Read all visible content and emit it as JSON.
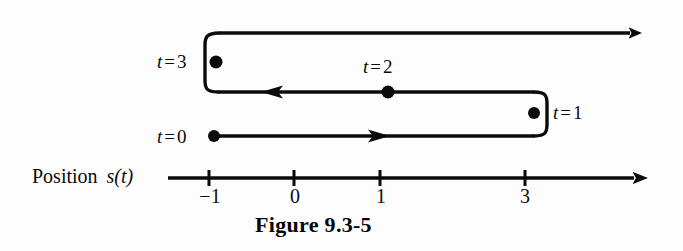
{
  "figure": {
    "caption": "Figure 9.3-5",
    "background_color": "#fdfdfd",
    "ink_color": "#0b0b0b"
  },
  "axis": {
    "name": "position-number-line",
    "label_word": "Position",
    "label_function": "s(t)",
    "arrow_direction": "right",
    "ticks": [
      {
        "label": "−1",
        "value": -1,
        "x": 209
      },
      {
        "label": "0",
        "value": 0,
        "x": 294
      },
      {
        "label": "1",
        "value": 1,
        "x": 380
      },
      {
        "label": "3",
        "value": 3,
        "x": 525
      }
    ],
    "line_y": 178,
    "line_start_x": 168,
    "line_end_x": 652
  },
  "motion_path": {
    "description": "Particle path doubling back along the position line",
    "points": [
      {
        "name": "t-zero",
        "t_label_var": "t",
        "t_label_eq": "=",
        "t_label_num": "0",
        "position": -1,
        "dot_x": 214,
        "dot_y": 136
      },
      {
        "name": "t-one",
        "t_label_var": "t",
        "t_label_eq": "=",
        "t_label_num": "1",
        "position": 3,
        "dot_x": 534,
        "dot_y": 113
      },
      {
        "name": "t-two",
        "t_label_var": "t",
        "t_label_eq": "=",
        "t_label_num": "2",
        "position": 1,
        "dot_x": 388,
        "dot_y": 92
      },
      {
        "name": "t-three",
        "t_label_var": "t",
        "t_label_eq": "=",
        "t_label_num": "3",
        "position": -1,
        "dot_x": 216,
        "dot_y": 62
      }
    ],
    "segments": [
      {
        "name": "segment-t0-to-t1",
        "from": "t = 0",
        "to": "t = 1",
        "direction": "right",
        "y": 136
      },
      {
        "name": "segment-t1-to-t3",
        "from": "t = 1",
        "to": "t = 3",
        "direction": "left",
        "y": 92
      },
      {
        "name": "segment-t3-onward",
        "from": "t = 3",
        "to": "onward",
        "direction": "right",
        "y": 33
      }
    ]
  }
}
